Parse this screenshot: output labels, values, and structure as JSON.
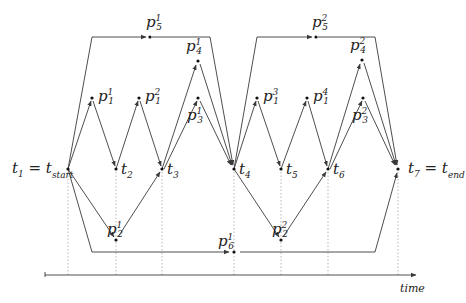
{
  "diagram": {
    "axis_label": "time",
    "colors": {
      "line": "#3a3a3a",
      "guide": "#9a9a9a",
      "node": "#111111",
      "text": "#222222"
    },
    "time_points": [
      {
        "id": "t1",
        "base": "t",
        "sub": "1",
        "suffix": "= t",
        "suffix_sub": "start",
        "x": 68,
        "y": 169
      },
      {
        "id": "t2",
        "base": "t",
        "sub": "2",
        "x": 116,
        "y": 169
      },
      {
        "id": "t3",
        "base": "t",
        "sub": "3",
        "x": 162,
        "y": 169
      },
      {
        "id": "t4",
        "base": "t",
        "sub": "4",
        "x": 234,
        "y": 169
      },
      {
        "id": "t5",
        "base": "t",
        "sub": "5",
        "x": 281,
        "y": 169
      },
      {
        "id": "t6",
        "base": "t",
        "sub": "6",
        "x": 328,
        "y": 169
      },
      {
        "id": "t7",
        "base": "t",
        "sub": "7",
        "suffix": "= t",
        "suffix_sub": "end",
        "x": 398,
        "y": 169
      }
    ],
    "activities": [
      {
        "id": "p1_1",
        "base": "p",
        "sub": "1",
        "sup": "1",
        "x": 92,
        "y": 98
      },
      {
        "id": "p1_2",
        "base": "p",
        "sub": "1",
        "sup": "2",
        "x": 139,
        "y": 98
      },
      {
        "id": "p3_1",
        "base": "p",
        "sub": "3",
        "sup": "1",
        "x": 198,
        "y": 98
      },
      {
        "id": "p4_1",
        "base": "p",
        "sub": "4",
        "sup": "1",
        "x": 198,
        "y": 61
      },
      {
        "id": "p5_1",
        "base": "p",
        "sub": "5",
        "sup": "1",
        "x": 150,
        "y": 37
      },
      {
        "id": "p2_1",
        "base": "p",
        "sub": "2",
        "sup": "1",
        "x": 116,
        "y": 240
      },
      {
        "id": "p6_1",
        "base": "p",
        "sub": "6",
        "sup": "1",
        "x": 234,
        "y": 252
      },
      {
        "id": "p1_3",
        "base": "p",
        "sub": "1",
        "sup": "3",
        "x": 257,
        "y": 98
      },
      {
        "id": "p1_4",
        "base": "p",
        "sub": "1",
        "sup": "4",
        "x": 307,
        "y": 98
      },
      {
        "id": "p3_2",
        "base": "p",
        "sub": "3",
        "sup": "2",
        "x": 363,
        "y": 98
      },
      {
        "id": "p4_2",
        "base": "p",
        "sub": "4",
        "sup": "2",
        "x": 362,
        "y": 60
      },
      {
        "id": "p5_2",
        "base": "p",
        "sub": "5",
        "sup": "2",
        "x": 316,
        "y": 37
      },
      {
        "id": "p2_2",
        "base": "p",
        "sub": "2",
        "sup": "2",
        "x": 281,
        "y": 240
      }
    ]
  }
}
